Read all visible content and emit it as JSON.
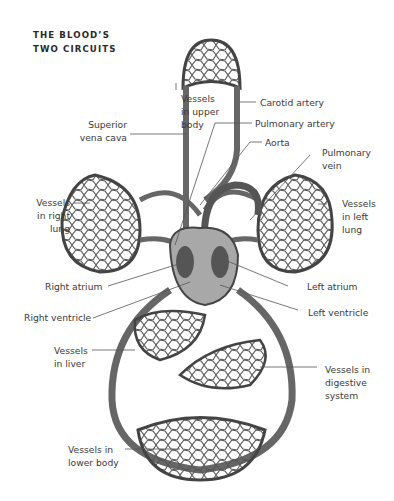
{
  "title": {
    "line1": "THE BLOOD’S",
    "line2": "TWO CIRCUITS"
  },
  "labels": {
    "vessels_upper_body": "Vessels\nin upper\nbody",
    "carotid_artery": "Carotid artery",
    "superior_vena_cava": "Superior\nvena cava",
    "pulmonary_artery": "Pulmonary artery",
    "aorta": "Aorta",
    "pulmonary_vein": "Pulmonary\nvein",
    "vessels_right_lung": "Vessels\nin right\nlung",
    "vessels_left_lung": "Vessels\nin left\nlung",
    "right_atrium": "Right atrium",
    "left_atrium": "Left atrium",
    "right_ventricle": "Right ventricle",
    "left_ventricle": "Left ventricle",
    "vessels_liver": "Vessels\nin liver",
    "vessels_digestive": "Vessels in\ndigestive\nsystem",
    "vessels_lower_body": "Vessels in\nlower body"
  },
  "colors": {
    "vessel": "#6a6a6a",
    "vessel_dark": "#3c3c3c",
    "leader": "#555555",
    "text": "#3a3a3a",
    "heart": "#9a9a9a"
  }
}
